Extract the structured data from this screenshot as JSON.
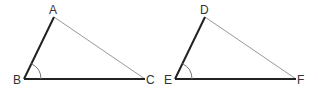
{
  "diagram": {
    "type": "geometry-triangles",
    "triangles": [
      {
        "name": "triangle-ABC",
        "vertices": {
          "A": {
            "label": "A",
            "x": 54,
            "y": 17
          },
          "B": {
            "label": "B",
            "x": 24,
            "y": 79
          },
          "C": {
            "label": "C",
            "x": 145,
            "y": 79
          }
        },
        "bold_sides": [
          "AB",
          "BC"
        ],
        "thin_sides": [
          "AC"
        ],
        "marked_angle": "B"
      },
      {
        "name": "triangle-DEF",
        "vertices": {
          "D": {
            "label": "D",
            "x": 205,
            "y": 17
          },
          "E": {
            "label": "E",
            "x": 175,
            "y": 79
          },
          "F": {
            "label": "F",
            "x": 296,
            "y": 79
          }
        },
        "bold_sides": [
          "DE",
          "EF"
        ],
        "thin_sides": [
          "DF"
        ],
        "marked_angle": "E"
      }
    ],
    "colors": {
      "bold_line": "#222222",
      "thin_line": "#999999",
      "label": "#333333"
    }
  }
}
